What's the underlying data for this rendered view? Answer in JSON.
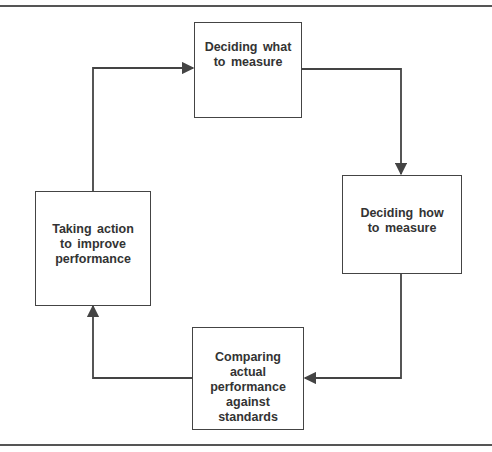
{
  "diagram": {
    "type": "cycle-flowchart",
    "nodes": [
      {
        "id": "measure-what",
        "label": "Deciding what to measure"
      },
      {
        "id": "measure-how",
        "label": "Deciding how to measure"
      },
      {
        "id": "compare",
        "label": "Comparing actual performance against standards"
      },
      {
        "id": "act",
        "label": "Taking action to improve performance"
      }
    ],
    "edges": [
      {
        "from": "measure-what",
        "to": "measure-how"
      },
      {
        "from": "measure-how",
        "to": "compare"
      },
      {
        "from": "compare",
        "to": "act"
      },
      {
        "from": "act",
        "to": "measure-what"
      }
    ],
    "colors": {
      "line": "#444444",
      "text": "#333333",
      "background": "#ffffff"
    }
  }
}
